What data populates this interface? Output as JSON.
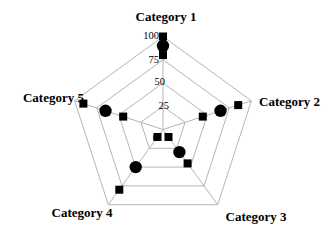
{
  "chart_data": {
    "type": "radar",
    "categories": [
      "Category 1",
      "Category 2",
      "Category 3",
      "Category 4",
      "Category 5"
    ],
    "series": [
      {
        "name": "squares-high",
        "marker": "square",
        "values": [
          100,
          85,
          45,
          80,
          90
        ]
      },
      {
        "name": "dots",
        "marker": "circle",
        "values": [
          90,
          65,
          30,
          50,
          65
        ]
      },
      {
        "name": "squares-low",
        "marker": "square",
        "values": [
          80,
          45,
          10,
          10,
          45
        ]
      }
    ],
    "radial_ticks": [
      0,
      25,
      50,
      75,
      100
    ],
    "axis_range": [
      0,
      100
    ],
    "grid_rings": [
      25,
      50,
      75,
      100
    ],
    "legend": "none",
    "colors": {
      "marker": "#000000",
      "grid": "#b5b5b5",
      "text": "#000000",
      "background": "#ffffff"
    }
  }
}
